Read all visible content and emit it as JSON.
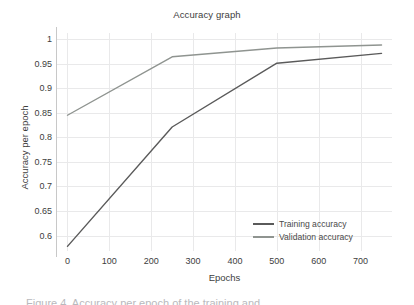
{
  "chart_data": {
    "type": "line",
    "title": "Accuracy graph",
    "xlabel": "Epochs",
    "ylabel": "Accuracy per epoch",
    "xlim": [
      -25,
      775
    ],
    "ylim": [
      0.5685,
      1.0125
    ],
    "xticks": [
      0,
      100,
      200,
      300,
      400,
      500,
      600,
      700
    ],
    "xtick_labels": [
      "0",
      "100",
      "200",
      "300",
      "400",
      "500",
      "600",
      "700"
    ],
    "yticks": [
      0.6,
      0.65,
      0.7,
      0.75,
      0.8,
      0.85,
      0.9,
      0.95,
      1
    ],
    "ytick_labels": [
      "0.6",
      "0.65",
      "0.7",
      "0.75",
      "0.8",
      "0.85",
      "0.9",
      "0.95",
      "1"
    ],
    "grid": true,
    "legend_position": "lower right",
    "series": [
      {
        "name": "Training accuracy",
        "color": "#5a5a5a",
        "x": [
          0,
          250,
          500,
          750
        ],
        "values": [
          0.578,
          0.821,
          0.951,
          0.971
        ]
      },
      {
        "name": "Validation accuracy",
        "color": "#8f9490",
        "x": [
          0,
          250,
          500,
          750
        ],
        "values": [
          0.845,
          0.964,
          0.982,
          0.988
        ]
      }
    ]
  },
  "caption": {
    "sliver_text": "Figure 4. Accuracy per epoch of the training and"
  }
}
